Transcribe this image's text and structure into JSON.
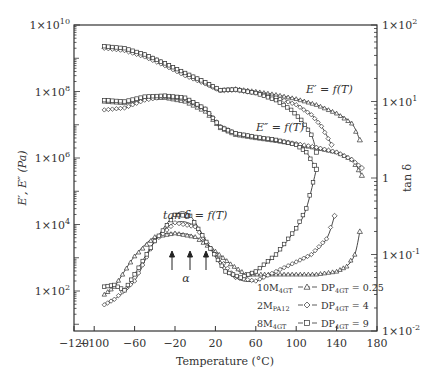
{
  "chart_data": {
    "type": "line",
    "title": "",
    "xlabel": "Temperature (°C)",
    "ylabel_left": "E′, E″ (Pa)",
    "ylabel_right": "tan δ",
    "xlim": [
      -120,
      180
    ],
    "ylim_left": [
      6.3,
      10000000000.0
    ],
    "ylim_right": [
      0.01,
      100
    ],
    "yscale_left": "log",
    "yscale_right": "log",
    "grid": false,
    "x_ticks": [
      "−120",
      "−100",
      "−60",
      "−20",
      "20",
      "60",
      "100",
      "140",
      "180"
    ],
    "x_tick_values": [
      -120,
      -100,
      -60,
      -20,
      20,
      60,
      100,
      140,
      180
    ],
    "y_ticks_left": [
      "1×10^10",
      "1×10^8",
      "1×10^6",
      "1×10^4",
      "1×10^2"
    ],
    "y_ticks_right": [
      "1×10^2",
      "1×10^1",
      "1",
      "1×10^-1",
      "1×10^-2"
    ],
    "annotations": [
      {
        "text": "E′ = f(T)",
        "x": 65,
        "y_left": 140000000.0
      },
      {
        "text": "E″ = f(T)",
        "x": 65,
        "y_left": 3000000.0
      },
      {
        "text": "tan δ = f(T)",
        "x": -35,
        "y_right": 0.3
      },
      {
        "text": "α",
        "x": -20,
        "y_right": 0.06,
        "note": "three upward arrows marking tan δ peaks at ≈ −38, −20, −5 °C"
      }
    ],
    "legend": {
      "position": "lower right",
      "entries": [
        {
          "label_left": "10M4GT",
          "marker": "triangle",
          "label_right": "DP4GT = 0.25"
        },
        {
          "label_left": "2MPA12",
          "marker": "diamond",
          "label_right": "DP4GT = 4"
        },
        {
          "label_left": "8M4GT",
          "marker": "square",
          "label_right": "DP4GT = 9"
        }
      ]
    },
    "series": [
      {
        "name": "E′ 10M4GT (DP4GT=0.25)",
        "axis": "left",
        "marker": "triangle",
        "x": [
          -90,
          -70,
          -50,
          -30,
          -10,
          10,
          25,
          40,
          60,
          80,
          100,
          120,
          140,
          155,
          163
        ],
        "y": [
          2200000000.0,
          1900000000.0,
          1300000000.0,
          700000000.0,
          350000000.0,
          190000000.0,
          110000000.0,
          120000000.0,
          100000000.0,
          80000000.0,
          60000000.0,
          40000000.0,
          22000000.0,
          11000000.0,
          3500000.0
        ]
      },
      {
        "name": "E′ 2MPA12 (DP4GT=4)",
        "axis": "left",
        "marker": "diamond",
        "x": [
          -90,
          -70,
          -50,
          -30,
          -10,
          10,
          25,
          40,
          60,
          80,
          100,
          115,
          125,
          135
        ],
        "y": [
          2000000000.0,
          1700000000.0,
          1100000000.0,
          600000000.0,
          300000000.0,
          170000000.0,
          105000000.0,
          110000000.0,
          90000000.0,
          65000000.0,
          40000000.0,
          20000000.0,
          9000000.0,
          2500000.0
        ]
      },
      {
        "name": "E′ 8M4GT (DP4GT=9)",
        "axis": "left",
        "marker": "square",
        "x": [
          -90,
          -70,
          -50,
          -30,
          -10,
          10,
          25,
          40,
          60,
          80,
          95,
          105,
          115,
          120
        ],
        "y": [
          2300000000.0,
          2000000000.0,
          1300000000.0,
          700000000.0,
          360000000.0,
          190000000.0,
          110000000.0,
          115000000.0,
          90000000.0,
          55000000.0,
          28000000.0,
          14000000.0,
          5000000.0,
          1500000.0
        ]
      },
      {
        "name": "E″ 10M4GT (DP4GT=0.25)",
        "axis": "left",
        "marker": "triangle",
        "x": [
          -90,
          -70,
          -50,
          -30,
          -10,
          10,
          25,
          40,
          60,
          80,
          100,
          120,
          140,
          155,
          165
        ],
        "y": [
          50000000.0,
          45000000.0,
          65000000.0,
          65000000.0,
          50000000.0,
          25000000.0,
          8000000.0,
          5000000.0,
          4000000.0,
          3300000.0,
          2600000.0,
          2000000.0,
          1500000.0,
          900000.0,
          300000.0
        ]
      },
      {
        "name": "E″ 2MPA12 (DP4GT=4)",
        "axis": "left",
        "marker": "diamond",
        "x": [
          -90,
          -70,
          -50,
          -30,
          -10,
          10,
          25,
          40,
          60,
          80,
          100,
          120,
          140,
          155,
          165
        ],
        "y": [
          28000000.0,
          32000000.0,
          55000000.0,
          70000000.0,
          60000000.0,
          30000000.0,
          9000000.0,
          5500000.0,
          4200000.0,
          3400000.0,
          2700000.0,
          2100000.0,
          1500000.0,
          900000.0,
          500000.0
        ]
      },
      {
        "name": "E″ 8M4GT (DP4GT=9)",
        "axis": "left",
        "marker": "square",
        "x": [
          -90,
          -70,
          -50,
          -30,
          -10,
          10,
          25,
          40,
          60,
          80,
          100,
          110,
          118
        ],
        "y": [
          55000000.0,
          50000000.0,
          70000000.0,
          75000000.0,
          65000000.0,
          30000000.0,
          8500000.0,
          5500000.0,
          4300000.0,
          3500000.0,
          2500000.0,
          1500000.0,
          600000.0
        ]
      },
      {
        "name": "tan δ 10M4GT (DP4GT=0.25)",
        "axis": "right",
        "marker": "triangle",
        "x": [
          -90,
          -80,
          -60,
          -40,
          -20,
          0,
          20,
          35,
          50,
          80,
          100,
          120,
          140,
          150,
          158,
          163
        ],
        "y": [
          0.03,
          0.038,
          0.095,
          0.17,
          0.19,
          0.17,
          0.11,
          0.075,
          0.055,
          0.055,
          0.055,
          0.055,
          0.06,
          0.07,
          0.1,
          0.2
        ]
      },
      {
        "name": "tan δ 2MPA12 (DP4GT=4)",
        "axis": "right",
        "marker": "diamond",
        "x": [
          -90,
          -80,
          -60,
          -40,
          -20,
          0,
          20,
          40,
          60,
          80,
          100,
          115,
          130,
          138
        ],
        "y": [
          0.022,
          0.026,
          0.045,
          0.15,
          0.26,
          0.23,
          0.1,
          0.05,
          0.045,
          0.06,
          0.08,
          0.1,
          0.16,
          0.32
        ]
      },
      {
        "name": "tan δ 8M4GT (DP4GT=9)",
        "axis": "right",
        "marker": "square",
        "x": [
          -90,
          -80,
          -70,
          -60,
          -40,
          -20,
          -5,
          15,
          30,
          45,
          60,
          80,
          100,
          110,
          120
        ],
        "y": [
          0.038,
          0.04,
          0.034,
          0.055,
          0.15,
          0.33,
          0.32,
          0.12,
          0.06,
          0.05,
          0.06,
          0.1,
          0.22,
          0.4,
          1.3
        ]
      }
    ]
  }
}
